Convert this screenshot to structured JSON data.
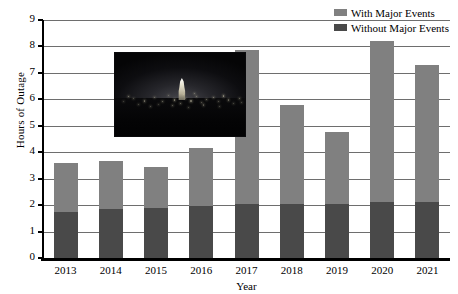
{
  "chart_data": {
    "type": "bar",
    "subtype": "stacked-vertical",
    "title": "",
    "xlabel": "Year",
    "ylabel": "Hours of Outage",
    "categories": [
      "2013",
      "2014",
      "2015",
      "2016",
      "2017",
      "2018",
      "2019",
      "2020",
      "2021"
    ],
    "ylim": [
      0,
      9
    ],
    "ytick_labels": [
      "0",
      "1",
      "2",
      "3",
      "4",
      "5",
      "6",
      "7",
      "8",
      "9"
    ],
    "ytick_values": [
      0,
      1,
      2,
      3,
      4,
      5,
      6,
      7,
      8,
      9
    ],
    "grid": "horizontal",
    "legend_position": "top-right",
    "series": [
      {
        "name": "Without Major Events",
        "color": "#494949",
        "values": [
          1.75,
          1.85,
          1.9,
          1.95,
          2.05,
          2.05,
          2.05,
          2.1,
          2.1
        ]
      },
      {
        "name": "With Major Events",
        "color": "#808080",
        "stacked_on": "Without Major Events",
        "values": [
          1.85,
          1.8,
          1.55,
          2.2,
          5.8,
          3.75,
          2.7,
          6.1,
          5.2
        ]
      }
    ],
    "totals": [
      3.6,
      3.65,
      3.45,
      4.15,
      7.85,
      5.8,
      4.75,
      8.2,
      7.3
    ]
  },
  "legend": {
    "items": [
      {
        "label": "With Major Events",
        "color": "#808080"
      },
      {
        "label": "Without Major Events",
        "color": "#494949"
      }
    ]
  },
  "axes": {
    "y_title": "Hours of Outage",
    "x_title": "Year"
  },
  "inset_photo": {
    "name": "night-cityscape-photo",
    "description": "Dark night cityscape with illuminated capitol dome and scattered city lights"
  },
  "colors": {
    "with_major_events": "#808080",
    "without_major_events": "#494949",
    "gridline": "#6e6e6e",
    "axis": "#000000",
    "background": "#ffffff"
  }
}
